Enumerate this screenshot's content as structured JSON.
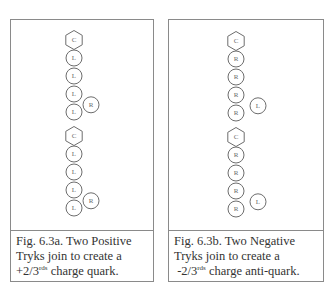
{
  "figures": [
    {
      "id": "fig-a",
      "caption_line1": "Fig. 6.3a. Two Positive",
      "caption_line2": "Tryks join to create a",
      "caption_line3_pre": "+2/3",
      "caption_line3_sup": "rds",
      "caption_line3_post": " charge quark.",
      "tryks": [
        {
          "core": "C",
          "chain": [
            "L",
            "L",
            "L",
            "L"
          ],
          "side": "R"
        },
        {
          "core": "C",
          "chain": [
            "L",
            "L",
            "L",
            "L"
          ],
          "side": "R"
        }
      ]
    },
    {
      "id": "fig-b",
      "caption_line1": "Fig. 6.3b. Two Negative",
      "caption_line2": "Tryks join to create a",
      "caption_line3_pre": " -2/3",
      "caption_line3_sup": "rds",
      "caption_line3_post": " charge anti-quark.",
      "tryks": [
        {
          "core": "C",
          "chain": [
            "R",
            "R",
            "R",
            "R"
          ],
          "side": "L"
        },
        {
          "core": "C",
          "chain": [
            "R",
            "R",
            "R",
            "R"
          ],
          "side": "L"
        }
      ]
    }
  ]
}
